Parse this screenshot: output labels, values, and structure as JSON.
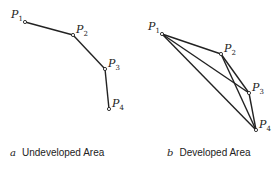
{
  "panels": [
    {
      "id": "a",
      "letter": "a",
      "caption": "Undeveloped Area",
      "points": [
        {
          "name": "P1",
          "x": 25,
          "y": 22
        },
        {
          "name": "P2",
          "x": 73,
          "y": 35
        },
        {
          "name": "P3",
          "x": 105,
          "y": 69
        },
        {
          "name": "P4",
          "x": 109,
          "y": 109
        }
      ],
      "edges": [
        [
          "P1",
          "P2"
        ],
        [
          "P2",
          "P3"
        ],
        [
          "P3",
          "P4"
        ]
      ]
    },
    {
      "id": "b",
      "letter": "b",
      "caption": "Developed Area",
      "points": [
        {
          "name": "P1",
          "x": 162,
          "y": 34
        },
        {
          "name": "P2",
          "x": 221,
          "y": 54
        },
        {
          "name": "P3",
          "x": 249,
          "y": 93
        },
        {
          "name": "P4",
          "x": 256,
          "y": 130
        }
      ],
      "edges": [
        [
          "P1",
          "P2"
        ],
        [
          "P1",
          "P3"
        ],
        [
          "P1",
          "P4"
        ],
        [
          "P2",
          "P3"
        ],
        [
          "P2",
          "P4"
        ],
        [
          "P3",
          "P4"
        ]
      ]
    }
  ],
  "labels": {
    "a": {
      "P1": "P",
      "P1_sub": "1",
      "P2": "P",
      "P2_sub": "2",
      "P3": "P",
      "P3_sub": "3",
      "P4": "P",
      "P4_sub": "4"
    },
    "b": {
      "P1": "P",
      "P1_sub": "1",
      "P2": "P",
      "P2_sub": "2",
      "P3": "P",
      "P3_sub": "3",
      "P4": "P",
      "P4_sub": "4"
    }
  },
  "colors": {
    "line": "#222222",
    "background": "#ffffff"
  }
}
